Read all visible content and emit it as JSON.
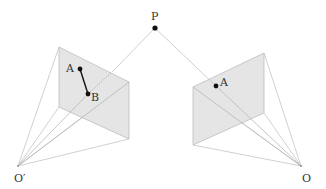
{
  "diagram": {
    "colors": {
      "plane_fill": "#e2e2e2",
      "plane_stroke": "#bdbdbd",
      "ray_stroke": "#c4c4c4",
      "point_fill": "#111111",
      "label": "#333333"
    },
    "points": {
      "P": {
        "label": "P",
        "x": 155,
        "y": 28
      },
      "O_prime": {
        "label": "O′",
        "x": 18,
        "y": 166
      },
      "O": {
        "label": "O",
        "x": 301,
        "y": 166
      }
    },
    "left_plane": {
      "corners": [
        [
          59,
          47
        ],
        [
          129,
          82
        ],
        [
          129,
          139
        ],
        [
          59,
          107
        ]
      ],
      "point_A": {
        "label": "A",
        "x": 80,
        "y": 69
      },
      "point_B": {
        "label": "B",
        "x": 88,
        "y": 94
      }
    },
    "right_plane": {
      "corners": [
        [
          193,
          87
        ],
        [
          264,
          53
        ],
        [
          264,
          113
        ],
        [
          193,
          145
        ]
      ],
      "point_A": {
        "label": "A",
        "x": 216,
        "y": 86
      }
    }
  }
}
